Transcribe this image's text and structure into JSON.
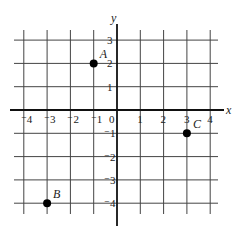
{
  "chart_data": {
    "type": "scatter",
    "title": "",
    "xlabel": "x",
    "ylabel": "y",
    "xlim": [
      -4,
      4
    ],
    "ylim": [
      -4,
      3
    ],
    "grid": true,
    "x_ticks": [
      "-4",
      "-3",
      "-2",
      "-1",
      "0",
      "1",
      "2",
      "3",
      "4"
    ],
    "y_ticks": [
      "3",
      "2",
      "1",
      "-1",
      "-2",
      "-3",
      "-4"
    ],
    "points": [
      {
        "label": "A",
        "x": -1,
        "y": 2
      },
      {
        "label": "B",
        "x": -3,
        "y": -4
      },
      {
        "label": "C",
        "x": 3,
        "y": -1
      }
    ]
  }
}
